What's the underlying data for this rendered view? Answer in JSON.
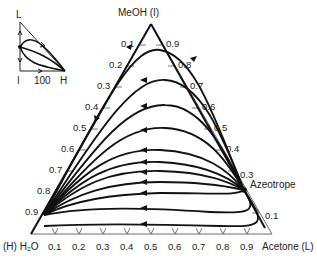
{
  "diagram": {
    "type": "ternary-residue-curve-map",
    "vertices": {
      "top": "MeOH (I)",
      "bottom_left": "(H) H₂O",
      "bottom_right": "Acetone (L)"
    },
    "left_edge_ticks": [
      "0.1",
      "0.2",
      "0.3",
      "0.4",
      "0.5",
      "0.6",
      "0.7",
      "0.8",
      "0.9"
    ],
    "right_edge_ticks": [
      "0.9",
      "0.8",
      "0.7",
      "0.6",
      "0.5",
      "0.4",
      "0.3",
      "0.1"
    ],
    "bottom_edge_ticks": [
      "0.1",
      "0.2",
      "0.3",
      "0.4",
      "0.5",
      "0.6",
      "0.7",
      "0.8",
      "0.9"
    ],
    "annotation": "Azeotrope",
    "inset": {
      "top_label": "L",
      "bottom_left_label": "I",
      "bottom_right_label": "H",
      "axis_label": "100"
    }
  }
}
